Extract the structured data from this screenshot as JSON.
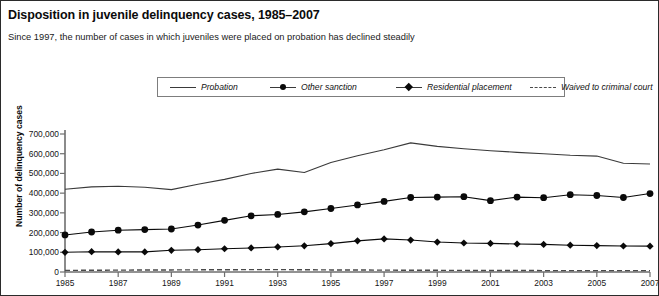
{
  "chart_data": {
    "type": "line",
    "title": "Disposition in juvenile delinquency cases, 1985–2007",
    "subtitle": "Since 1997, the number of cases in which juveniles were placed on probation has declined steadily",
    "xlabel": "",
    "ylabel": "Number of delinquency cases",
    "x": [
      1985,
      1986,
      1987,
      1988,
      1989,
      1990,
      1991,
      1992,
      1993,
      1994,
      1995,
      1996,
      1997,
      1998,
      1999,
      2000,
      2001,
      2002,
      2003,
      2004,
      2005,
      2006,
      2007
    ],
    "xlim": [
      1985,
      2007
    ],
    "ylim": [
      0,
      700000
    ],
    "yticks": [
      0,
      100000,
      200000,
      300000,
      400000,
      500000,
      600000,
      700000
    ],
    "ytick_labels": [
      "0",
      "100,000",
      "200,000",
      "300,000",
      "400,000",
      "500,000",
      "600,000",
      "700,000"
    ],
    "xticks": [
      1985,
      1987,
      1989,
      1991,
      1993,
      1995,
      1997,
      1999,
      2001,
      2003,
      2005,
      2007
    ],
    "xtick_labels": [
      "1985",
      "1987",
      "1989",
      "1991",
      "1993",
      "1995",
      "1997",
      "1999",
      "2001",
      "2003",
      "2005",
      "2007"
    ],
    "grid": false,
    "legend_position": "top",
    "series": [
      {
        "name": "Probation",
        "marker": "none",
        "line": "solid",
        "color": "#3a3a3a",
        "values": [
          420000,
          432000,
          435000,
          430000,
          418000,
          445000,
          470000,
          500000,
          522000,
          505000,
          555000,
          590000,
          620000,
          655000,
          637000,
          625000,
          615000,
          607000,
          600000,
          592000,
          588000,
          552000,
          548000
        ]
      },
      {
        "name": "Other sanction",
        "marker": "circle",
        "line": "solid",
        "color": "#0a0a0a",
        "values": [
          188000,
          203000,
          212000,
          215000,
          218000,
          238000,
          262000,
          285000,
          292000,
          305000,
          322000,
          340000,
          358000,
          378000,
          380000,
          382000,
          362000,
          380000,
          377000,
          392000,
          388000,
          378000,
          398000
        ]
      },
      {
        "name": "Residential placement",
        "marker": "diamond",
        "line": "solid",
        "color": "#0a0a0a",
        "values": [
          100000,
          103000,
          102000,
          102000,
          110000,
          113000,
          118000,
          122000,
          127000,
          133000,
          144000,
          158000,
          168000,
          162000,
          152000,
          147000,
          145000,
          142000,
          140000,
          136000,
          134000,
          132000,
          131000
        ]
      },
      {
        "name": "Waived to criminal court",
        "marker": "none",
        "line": "dashed",
        "color": "#4a4a4a",
        "values": [
          8000,
          9000,
          9500,
          10000,
          10500,
          11000,
          11500,
          12000,
          12000,
          11500,
          10500,
          10000,
          9500,
          9000,
          8500,
          8000,
          7500,
          7500,
          7200,
          7000,
          7000,
          7000,
          7000
        ]
      }
    ]
  }
}
